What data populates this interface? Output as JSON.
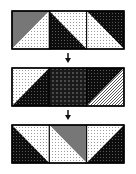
{
  "diagram": {
    "colors": {
      "black": "#111111",
      "gray": "#777777",
      "white": "#ffffff",
      "outline": "#000000"
    },
    "rows": [
      {
        "name": "row-1",
        "squares": [
          {
            "diagonal": "bl-tr",
            "tri_a": "gray",
            "tri_b": "dots"
          },
          {
            "diagonal": "tl-br",
            "tri_a": "dots",
            "tri_b": "black-check"
          },
          {
            "diagonal": "tl-br",
            "tri_a": "black-check",
            "tri_b": "dots"
          }
        ]
      },
      {
        "name": "row-2",
        "squares": [
          {
            "diagonal": "bl-tr",
            "tri_a": "dots",
            "tri_b": "black-check"
          },
          {
            "diagonal": "none",
            "tri_a": "dark-grid",
            "tri_b": "dark-grid"
          },
          {
            "diagonal": "bl-tr",
            "tri_a": "black-check",
            "tri_b": "white-check"
          }
        ]
      },
      {
        "name": "row-3",
        "squares": [
          {
            "diagonal": "tl-br",
            "tri_a": "dots",
            "tri_b": "black-check"
          },
          {
            "diagonal": "tl-br",
            "tri_a": "gray",
            "tri_b": "dots"
          },
          {
            "diagonal": "bl-tr",
            "tri_a": "dots",
            "tri_b": "black-check"
          }
        ]
      }
    ],
    "arrows": [
      {
        "from": "row-1",
        "to": "row-2",
        "direction": "down"
      },
      {
        "from": "row-2",
        "to": "row-3",
        "direction": "down"
      }
    ]
  }
}
